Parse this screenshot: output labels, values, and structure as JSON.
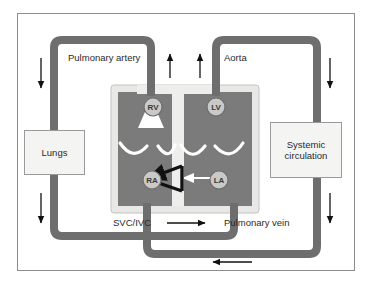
{
  "diagram": {
    "vessel_labels": {
      "pulmonary_artery": "Pulmonary artery",
      "aorta": "Aorta",
      "svc_ivc": "SVC/IVC",
      "pulmonary_vein": "Pulmonary vein"
    },
    "chambers": [
      {
        "id": "rv",
        "label": "RV",
        "name": "right-ventricle"
      },
      {
        "id": "lv",
        "label": "LV",
        "name": "left-ventricle"
      },
      {
        "id": "ra",
        "label": "RA",
        "name": "right-atrium"
      },
      {
        "id": "la",
        "label": "LA",
        "name": "left-atrium"
      }
    ],
    "organ_boxes": [
      {
        "id": "lungs",
        "label": "Lungs"
      },
      {
        "id": "systemic",
        "label_line1": "Systemic",
        "label_line2": "circulation"
      }
    ],
    "colors": {
      "background": "#ffffff",
      "frame_border": "#8c8c8c",
      "vessel": "#6e6e6e",
      "chamber_fill": "#7b7b7b",
      "heart_outline": "#e8e8e6",
      "heart_outline_border": "#b8b8b6",
      "septum": "#eeeeec",
      "valve": "#ffffff",
      "badge_fill": "#c9c9c7",
      "badge_border": "#6e6e6e",
      "arrow_black": "#111111",
      "arrow_white": "#ffffff",
      "organ_box_fill": "#f4f4f2",
      "organ_box_border": "#9a9a9a",
      "text": "#2b2b2b"
    }
  }
}
